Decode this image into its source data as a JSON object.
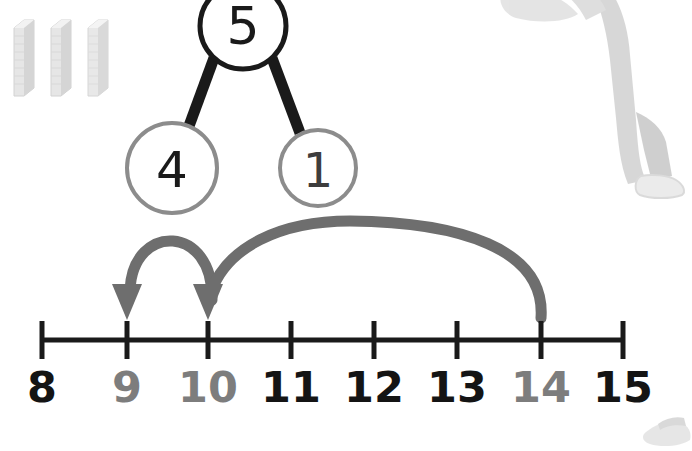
{
  "worksheet": {
    "title": "Number bond and number line addition",
    "manipulatives": {
      "name": "base-ten-rods",
      "count": 3,
      "color": "#e3e3e3",
      "positions_x": [
        14,
        51,
        88
      ]
    },
    "photo_top_right": {
      "name": "child-photo",
      "description": "faded grayscale photo of a child standing",
      "color": "#c9c9c9"
    },
    "photo_bottom_right": {
      "name": "shoe-photo-fragment",
      "description": "faint grayscale shoe fragment",
      "color": "#d6d6d6"
    }
  },
  "number_bond": {
    "whole": {
      "value": "5",
      "cx": 243,
      "cy": 26,
      "r": 43,
      "stroke": "#1a1a1a",
      "stroke_width": 5,
      "text_color": "#1a1a1a",
      "font_size": 52
    },
    "parts": [
      {
        "value": "4",
        "cx": 172,
        "cy": 168,
        "r": 45,
        "stroke": "#8c8c8c",
        "stroke_width": 4,
        "text_color": "#1a1a1a",
        "font_size": 50
      },
      {
        "value": "1",
        "cx": 318,
        "cy": 168,
        "r": 38,
        "stroke": "#8c8c8c",
        "stroke_width": 4,
        "text_color": "#3d3d3d",
        "font_size": 48
      }
    ],
    "connectors": [
      {
        "name": "connector-whole-to-part-4",
        "x1": 214,
        "y1": 58,
        "x2": 189,
        "y2": 126,
        "color": "#1a1a1a",
        "width": 11
      },
      {
        "name": "connector-whole-to-part-1",
        "x1": 272,
        "y1": 58,
        "x2": 300,
        "y2": 133,
        "color": "#1a1a1a",
        "width": 11
      }
    ]
  },
  "number_line": {
    "axis": {
      "y": 340,
      "x_start": 42,
      "x_end": 623,
      "color": "#1a1a1a",
      "line_width": 5,
      "tick_half_height": 19,
      "tick_width": 5
    },
    "ticks": [
      {
        "label": "8",
        "x": 42,
        "color": "#141414"
      },
      {
        "label": "9",
        "x": 127,
        "color": "#7d7d7d"
      },
      {
        "label": "10",
        "x": 208,
        "color": "#7d7d7d"
      },
      {
        "label": "11",
        "x": 291,
        "color": "#141414"
      },
      {
        "label": "12",
        "x": 374,
        "color": "#141414"
      },
      {
        "label": "13",
        "x": 457,
        "color": "#141414"
      },
      {
        "label": "14",
        "x": 541,
        "color": "#7d7d7d"
      },
      {
        "label": "15",
        "x": 623,
        "color": "#141414"
      }
    ],
    "label_y": 364,
    "jumps": [
      {
        "name": "jump-arc-small",
        "from": "10",
        "to": "9",
        "direction": "backward",
        "path": "M 212 300 C 214 224 133 222 130 290",
        "color": "#6e6e6e",
        "width": 11,
        "arrowhead": {
          "x": 127,
          "y": 318,
          "width": 30,
          "height": 34
        }
      },
      {
        "name": "jump-arc-large",
        "from": "14",
        "to": "10",
        "direction": "backward",
        "path": "M 541 318 C 545 250 460 222 350 221 C 280 221 226 246 211 292",
        "color": "#6e6e6e",
        "width": 11,
        "arrowhead": {
          "x": 208,
          "y": 318,
          "width": 30,
          "height": 34
        }
      }
    ]
  }
}
